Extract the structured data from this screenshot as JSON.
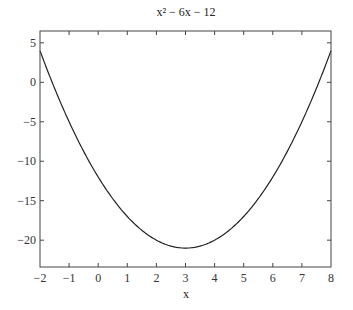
{
  "chart_data": {
    "type": "line",
    "title": "x² − 6x − 12",
    "xlabel": "x",
    "ylabel": "",
    "function": "x^2 - 6x - 12",
    "xlim": [
      -2,
      8
    ],
    "ylim": [
      -23.4,
      6.5
    ],
    "xticks": [
      -2,
      -1,
      0,
      1,
      2,
      3,
      4,
      5,
      6,
      7,
      8
    ],
    "xtick_labels": [
      "-2",
      "-1",
      "0",
      "1",
      "2",
      "3",
      "4",
      "5",
      "6",
      "7",
      "8"
    ],
    "yticks": [
      5,
      0,
      -5,
      -10,
      -15,
      -20
    ],
    "ytick_labels": [
      "5",
      "0",
      "−5",
      "−10",
      "−15",
      "−20"
    ],
    "grid": false,
    "legend": null,
    "series": [
      {
        "name": "x² − 6x − 12",
        "x": [
          -2,
          -1,
          0,
          1,
          2,
          3,
          4,
          5,
          6,
          7,
          8
        ],
        "y": [
          4,
          -5,
          -12,
          -17,
          -20,
          -21,
          -20,
          -17,
          -12,
          -5,
          4
        ]
      }
    ],
    "line_color": "#222222"
  }
}
